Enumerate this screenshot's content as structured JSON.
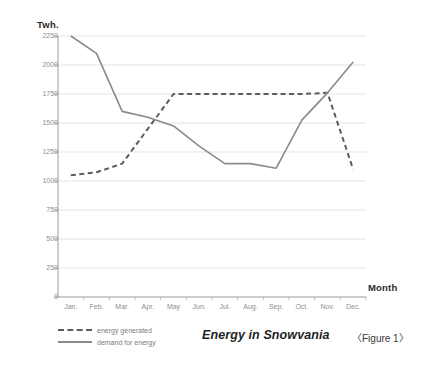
{
  "figure": {
    "caption": "〈Figure 1〉",
    "title": "Energy in Snowvania"
  },
  "legend": {
    "items": [
      {
        "label": "energy generated",
        "style": "dashed",
        "color": "#5c5c5c"
      },
      {
        "label": "demand for energy",
        "style": "solid",
        "color": "#8a8a8a"
      }
    ]
  },
  "chart_data": {
    "type": "line",
    "title": "Energy in Snowvania",
    "xlabel": "Month",
    "ylabel": "Twh.",
    "categories": [
      "Jan.",
      "Feb.",
      "Mar.",
      "Apr.",
      "May",
      "Jun.",
      "Jul.",
      "Aug.",
      "Sep.",
      "Oct.",
      "Nov.",
      "Dec."
    ],
    "ylim": [
      0,
      2250
    ],
    "yticks": [
      0,
      250,
      500,
      750,
      1000,
      1250,
      1500,
      1750,
      2000,
      2250
    ],
    "ytick_labels": [
      "0",
      "250",
      "500",
      "750",
      "1000",
      "1250",
      "1500",
      "1750",
      "2000",
      "2250"
    ],
    "grid": true,
    "legend_position": "bottom-left",
    "series": [
      {
        "name": "energy generated",
        "style": "dashed",
        "color": "#5c5c5c",
        "values": [
          1050,
          1075,
          1150,
          1450,
          1750,
          1750,
          1750,
          1750,
          1750,
          1750,
          1760,
          1100
        ]
      },
      {
        "name": "demand for energy",
        "style": "solid",
        "color": "#8a8a8a",
        "values": [
          2250,
          2100,
          1600,
          1550,
          1475,
          1300,
          1150,
          1150,
          1110,
          1525,
          1760,
          2025
        ]
      }
    ]
  }
}
